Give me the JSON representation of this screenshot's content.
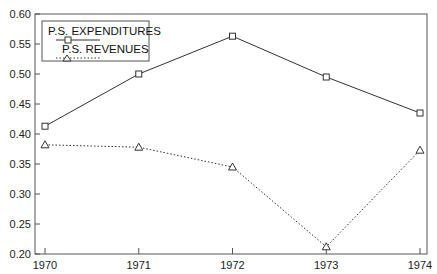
{
  "chart_data": {
    "type": "line",
    "title": "",
    "xlabel": "",
    "ylabel": "",
    "x": [
      1970,
      1971,
      1972,
      1973,
      1974
    ],
    "categories": [
      "1970",
      "1971",
      "1972",
      "1973",
      "1974"
    ],
    "ylim": [
      0.2,
      0.6
    ],
    "yticks": [
      "0.20",
      "0.25",
      "0.30",
      "0.35",
      "0.40",
      "0.45",
      "0.50",
      "0.55",
      "0.60"
    ],
    "grid": false,
    "legend_position": "upper left",
    "series": [
      {
        "name": "P.S. EXPENDITURES",
        "marker": "square",
        "linestyle": "solid",
        "values": [
          0.413,
          0.5,
          0.563,
          0.495,
          0.435
        ]
      },
      {
        "name": "P.S. REVENUES",
        "marker": "triangle",
        "linestyle": "dotted",
        "values": [
          0.382,
          0.378,
          0.345,
          0.212,
          0.373
        ]
      }
    ]
  },
  "legend": {
    "items": [
      "P.S. EXPENDITURES",
      "P.S. REVENUES"
    ]
  },
  "colors": {
    "line": "#333333",
    "axis": "#555555"
  }
}
